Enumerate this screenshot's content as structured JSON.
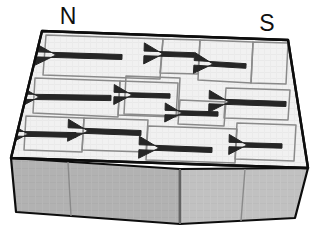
{
  "figure": {
    "background_color": "#ffffff"
  },
  "labels": {
    "north_pole": "N",
    "south_pole": "S"
  },
  "colors": {
    "top_face": "#f0f0f0",
    "front_face": "#b2b2b2",
    "right_face": "#c2c2c2",
    "outline": "#0d0d0d",
    "domain_boundary": "#8a8a8a",
    "arrow": "#262626",
    "label_text": "#101010"
  },
  "block": {
    "name": "magnet-block",
    "top_face_points": "42,31 288,40 308,168 11,158",
    "front_face_points": "11,158 180,169 180,224 16,212",
    "right_face_points": "180,169 308,168 295,218 180,224",
    "front_divider_lines": [
      "68,162 71,216",
      "180,169 180,224",
      "245,169 241,221"
    ]
  },
  "domains": [
    {
      "id": "domain-1",
      "outline": "46,35 163,39 160,79 43,75",
      "arrow": {
        "tail_x": 122,
        "tail_y": 57,
        "head_x": 56,
        "head_y": 55,
        "shaft_w": 5.0,
        "head_w": 23,
        "head_len": 22
      }
    },
    {
      "id": "domain-2",
      "outline": "163,39 200,40 198,74 160,73",
      "arrow": {
        "tail_x": 194,
        "tail_y": 55,
        "head_x": 163,
        "head_y": 54,
        "shaft_w": 4.6,
        "head_w": 21,
        "head_len": 19
      }
    },
    {
      "id": "domain-3",
      "outline": "200,40 253,42 251,83 198,80",
      "arrow": {
        "tail_x": 246,
        "tail_y": 66,
        "head_x": 213,
        "head_y": 64,
        "shaft_w": 4.6,
        "head_w": 21,
        "head_len": 19
      }
    },
    {
      "id": "domain-4",
      "outline": "253,42 288,43 286,84 251,83",
      "arrow": null
    },
    {
      "id": "domain-5",
      "outline": "35,78 120,81 118,117 33,113",
      "arrow": {
        "tail_x": 111,
        "tail_y": 98,
        "head_x": 39,
        "head_y": 97,
        "shaft_w": 5.2,
        "head_w": 24,
        "head_len": 22
      }
    },
    {
      "id": "domain-6",
      "outline": "120,81 178,83 176,117 118,115",
      "arrow": null
    },
    {
      "id": "domain-7",
      "outline": "126,76 180,78 178,116 124,114",
      "arrow": {
        "tail_x": 170,
        "tail_y": 96,
        "head_x": 132,
        "head_y": 95,
        "shaft_w": 4.4,
        "head_w": 20,
        "head_len": 18
      }
    },
    {
      "id": "domain-8",
      "outline": "180,100 226,102 224,126 178,124",
      "arrow": {
        "tail_x": 218,
        "tail_y": 114,
        "head_x": 182,
        "head_y": 113,
        "shaft_w": 4.4,
        "head_w": 19,
        "head_len": 17
      }
    },
    {
      "id": "domain-9",
      "outline": "226,88 290,90 288,120 224,118",
      "arrow": {
        "tail_x": 286,
        "tail_y": 104,
        "head_x": 229,
        "head_y": 102,
        "shaft_w": 5.0,
        "head_w": 22,
        "head_len": 20
      }
    },
    {
      "id": "domain-10",
      "outline": "26,116 84,118 82,152 24,150",
      "arrow": {
        "tail_x": 76,
        "tail_y": 135,
        "head_x": 28,
        "head_y": 134,
        "shaft_w": 4.8,
        "head_w": 21,
        "head_len": 19
      }
    },
    {
      "id": "domain-11",
      "outline": "84,118 148,120 146,152 82,150",
      "arrow": {
        "tail_x": 141,
        "tail_y": 133,
        "head_x": 88,
        "head_y": 131,
        "shaft_w": 5.0,
        "head_w": 22,
        "head_len": 20
      }
    },
    {
      "id": "domain-12",
      "outline": "148,126 237,129 235,163 146,160",
      "arrow": {
        "tail_x": 212,
        "tail_y": 150,
        "head_x": 159,
        "head_y": 148,
        "shaft_w": 5.0,
        "head_w": 22,
        "head_len": 20
      }
    },
    {
      "id": "domain-13",
      "outline": "237,123 296,125 294,161 235,159",
      "arrow": {
        "tail_x": 282,
        "tail_y": 146,
        "head_x": 247,
        "head_y": 145,
        "shaft_w": 4.4,
        "head_w": 20,
        "head_len": 18
      }
    }
  ],
  "label_positions": {
    "north": {
      "x": 68,
      "y": 18
    },
    "south": {
      "x": 267,
      "y": 25
    }
  }
}
